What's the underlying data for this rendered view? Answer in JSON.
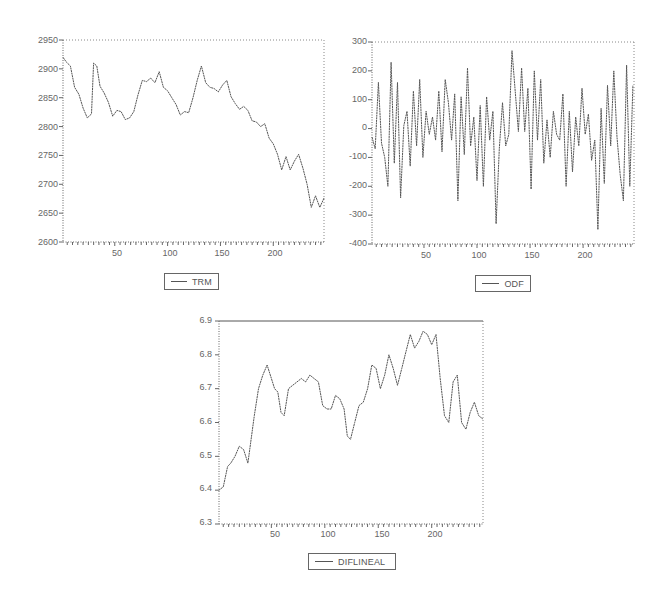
{
  "chart_data": [
    {
      "type": "line",
      "title": "",
      "xlabel": "",
      "ylabel": "",
      "legend": [
        "TRM"
      ],
      "legend_position": "bottom",
      "grid": false,
      "xlim": [
        1,
        248
      ],
      "ylim": [
        2600,
        2950
      ],
      "x_ticks": [
        50,
        100,
        150,
        200
      ],
      "y_ticks": [
        2600,
        2650,
        2700,
        2750,
        2800,
        2850,
        2900,
        2950
      ],
      "series": [
        {
          "name": "TRM",
          "x": [
            1,
            4,
            8,
            12,
            16,
            20,
            24,
            28,
            30,
            33,
            36,
            40,
            44,
            48,
            52,
            56,
            60,
            64,
            68,
            72,
            76,
            80,
            84,
            88,
            92,
            96,
            100,
            104,
            108,
            112,
            116,
            120,
            124,
            128,
            132,
            136,
            140,
            144,
            148,
            152,
            156,
            160,
            164,
            168,
            172,
            176,
            180,
            184,
            188,
            192,
            196,
            200,
            204,
            208,
            212,
            216,
            220,
            224,
            228,
            232,
            236,
            240,
            244,
            248
          ],
          "values": [
            2920,
            2912,
            2905,
            2868,
            2856,
            2832,
            2815,
            2822,
            2910,
            2905,
            2870,
            2858,
            2842,
            2818,
            2828,
            2826,
            2812,
            2815,
            2826,
            2855,
            2880,
            2878,
            2884,
            2876,
            2895,
            2868,
            2862,
            2850,
            2838,
            2820,
            2826,
            2824,
            2850,
            2880,
            2905,
            2876,
            2868,
            2866,
            2860,
            2872,
            2880,
            2852,
            2840,
            2830,
            2835,
            2828,
            2810,
            2808,
            2800,
            2805,
            2780,
            2770,
            2752,
            2725,
            2748,
            2725,
            2740,
            2752,
            2728,
            2700,
            2660,
            2680,
            2660,
            2676
          ]
        }
      ]
    },
    {
      "type": "line",
      "title": "",
      "xlabel": "",
      "ylabel": "",
      "legend": [
        "ODF"
      ],
      "legend_position": "bottom",
      "grid": false,
      "xlim": [
        1,
        248
      ],
      "ylim": [
        -400,
        300
      ],
      "x_ticks": [
        50,
        100,
        150,
        200
      ],
      "y_ticks": [
        -400,
        -300,
        -200,
        -100,
        0,
        100,
        200,
        300
      ],
      "series": [
        {
          "name": "ODF",
          "x": [
            1,
            4,
            7,
            10,
            13,
            16,
            19,
            22,
            25,
            28,
            31,
            34,
            37,
            40,
            43,
            46,
            49,
            52,
            55,
            58,
            61,
            64,
            67,
            70,
            73,
            76,
            79,
            82,
            85,
            88,
            91,
            94,
            97,
            100,
            103,
            106,
            109,
            112,
            115,
            118,
            121,
            124,
            127,
            130,
            133,
            136,
            139,
            142,
            145,
            148,
            151,
            154,
            157,
            160,
            163,
            166,
            169,
            172,
            175,
            178,
            181,
            184,
            187,
            190,
            193,
            196,
            199,
            202,
            205,
            208,
            211,
            214,
            217,
            220,
            223,
            226,
            229,
            232,
            235,
            238,
            241,
            244,
            247
          ],
          "values": [
            -30,
            -70,
            160,
            -50,
            -100,
            -200,
            230,
            -120,
            160,
            -240,
            10,
            60,
            -130,
            130,
            -60,
            170,
            -100,
            60,
            -20,
            40,
            -40,
            130,
            -80,
            170,
            90,
            -40,
            120,
            -250,
            110,
            -90,
            210,
            -60,
            40,
            -180,
            80,
            -200,
            110,
            -40,
            60,
            -330,
            -70,
            90,
            -60,
            -20,
            270,
            130,
            -10,
            210,
            -10,
            140,
            -210,
            200,
            -40,
            170,
            -120,
            30,
            -100,
            60,
            -20,
            -40,
            120,
            -200,
            60,
            -150,
            40,
            -60,
            140,
            -20,
            50,
            -110,
            -40,
            -350,
            70,
            -190,
            150,
            -60,
            200,
            -30,
            -160,
            -250,
            220,
            -200,
            150
          ]
        }
      ]
    },
    {
      "type": "line",
      "title": "",
      "xlabel": "",
      "ylabel": "",
      "legend": [
        "DIFLINEAL"
      ],
      "legend_position": "bottom",
      "grid": false,
      "xlim": [
        1,
        248
      ],
      "ylim": [
        6.3,
        6.9
      ],
      "x_ticks": [
        50,
        100,
        150,
        200
      ],
      "y_ticks": [
        6.3,
        6.4,
        6.5,
        6.6,
        6.7,
        6.8,
        6.9
      ],
      "series": [
        {
          "name": "DIFLINEAL",
          "x": [
            1,
            5,
            9,
            12,
            16,
            20,
            24,
            28,
            31,
            34,
            38,
            42,
            46,
            50,
            53,
            56,
            59,
            62,
            66,
            70,
            74,
            78,
            82,
            86,
            90,
            94,
            98,
            102,
            106,
            110,
            114,
            118,
            121,
            124,
            128,
            132,
            136,
            140,
            144,
            148,
            152,
            156,
            160,
            164,
            168,
            172,
            176,
            180,
            184,
            188,
            192,
            196,
            200,
            204,
            208,
            212,
            216,
            220,
            224,
            228,
            232,
            236,
            240,
            244,
            248
          ],
          "values": [
            6.4,
            6.41,
            6.47,
            6.48,
            6.5,
            6.53,
            6.52,
            6.48,
            6.55,
            6.62,
            6.7,
            6.74,
            6.77,
            6.73,
            6.7,
            6.69,
            6.63,
            6.62,
            6.7,
            6.71,
            6.72,
            6.73,
            6.72,
            6.74,
            6.73,
            6.72,
            6.65,
            6.64,
            6.64,
            6.68,
            6.67,
            6.64,
            6.56,
            6.55,
            6.6,
            6.65,
            6.66,
            6.7,
            6.77,
            6.76,
            6.7,
            6.74,
            6.8,
            6.76,
            6.71,
            6.76,
            6.81,
            6.86,
            6.82,
            6.84,
            6.87,
            6.86,
            6.83,
            6.86,
            6.73,
            6.62,
            6.6,
            6.72,
            6.74,
            6.6,
            6.58,
            6.63,
            6.66,
            6.62,
            6.61
          ]
        }
      ]
    }
  ],
  "legends": {
    "trm": "TRM",
    "odf": "ODF",
    "diflineal": "DIFLINEAL"
  },
  "axes": {
    "trm": {
      "y_labels": [
        "2950",
        "2900",
        "2850",
        "2800",
        "2750",
        "2700",
        "2650",
        "2600"
      ],
      "x_labels": [
        "50",
        "100",
        "150",
        "200"
      ]
    },
    "odf": {
      "y_labels": [
        "300",
        "200",
        "100",
        "0",
        "-100",
        "-200",
        "-300",
        "-400"
      ],
      "x_labels": [
        "50",
        "100",
        "150",
        "200"
      ]
    },
    "diflineal": {
      "y_labels": [
        "6.9",
        "6.8",
        "6.7",
        "6.6",
        "6.5",
        "6.4",
        "6.3"
      ],
      "x_labels": [
        "50",
        "100",
        "150",
        "200"
      ]
    }
  },
  "colors": {
    "line": "#555555",
    "frame": "#888888",
    "axis": "#666666",
    "background": "#ffffff"
  }
}
